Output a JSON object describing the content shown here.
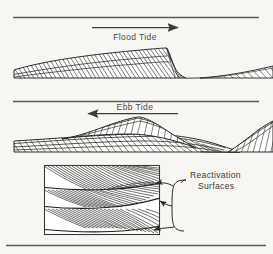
{
  "figure": {
    "title_flood": "Flood Tide",
    "title_ebb": "Ebb Tide",
    "annotation_line1": "Reactivation",
    "annotation_line2": "Surfaces",
    "colors": {
      "background": "#f7f6f2",
      "ink": "#2b2b28",
      "rule": "#5a5a55",
      "text": "#4a4a46",
      "fill": "#ffffff"
    },
    "panels": [
      {
        "name": "flood-tide-panel",
        "label": "Flood Tide",
        "arrow_direction": "right",
        "description": "Asymmetric sand wave with gentle stoss slope dipping to the right and steep lee face; flood-oriented cross-bedding"
      },
      {
        "name": "ebb-tide-panel",
        "label": "Ebb Tide",
        "arrow_direction": "left",
        "description": "Reversed asymmetric bedform with crest and ebb-oriented cross-bedding draping the flood bedform"
      },
      {
        "name": "detail-box-panel",
        "label": "Reactivation Surfaces",
        "arrow_direction": "left",
        "description": "Enlarged block of cross-bedded sandstone showing stacked foresets truncated by three reactivation surfaces"
      }
    ],
    "bracket_pointers": 3,
    "rules": [
      {
        "name": "top-rule",
        "y": 17
      },
      {
        "name": "bottom-rule",
        "y": 245
      }
    ]
  }
}
